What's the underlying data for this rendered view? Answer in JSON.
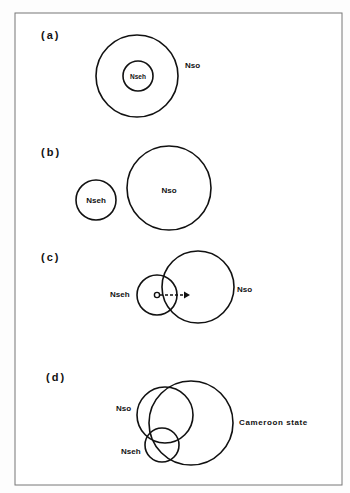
{
  "figure": {
    "panels": [
      {
        "id": "a",
        "label": "(a)",
        "circles": [
          {
            "name": "Nso",
            "label": "Nso",
            "cx": 137,
            "cy": 76,
            "r": 41
          },
          {
            "name": "Nseh",
            "label": "Nseh",
            "cx": 138,
            "cy": 76,
            "r": 15
          }
        ]
      },
      {
        "id": "b",
        "label": "(b)",
        "circles": [
          {
            "name": "Nseh",
            "label": "Nseh",
            "cx": 96,
            "cy": 200,
            "r": 20
          },
          {
            "name": "Nso",
            "label": "Nso",
            "cx": 169,
            "cy": 188,
            "r": 42
          }
        ]
      },
      {
        "id": "c",
        "label": "(c)",
        "circles": [
          {
            "name": "Nseh",
            "label": "Nseh",
            "cx": 157,
            "cy": 295,
            "r": 20
          },
          {
            "name": "Nso",
            "label": "Nso",
            "cx": 198,
            "cy": 287,
            "r": 36
          }
        ]
      },
      {
        "id": "d",
        "label": "(d)",
        "circles": [
          {
            "name": "Nso",
            "label": "Nso",
            "cx": 165,
            "cy": 415,
            "r": 28
          },
          {
            "name": "Cameroon state",
            "label": "Cameroon state",
            "cx": 191,
            "cy": 423,
            "r": 42
          },
          {
            "name": "Nseh",
            "label": "Nseh",
            "cx": 162,
            "cy": 445,
            "r": 17
          }
        ]
      }
    ]
  }
}
